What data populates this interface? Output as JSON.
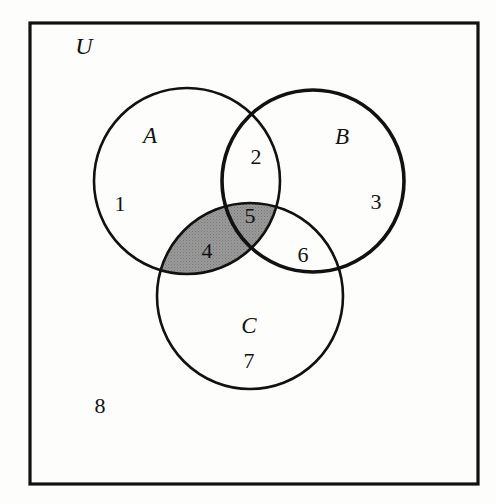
{
  "figure": {
    "type": "venn-diagram",
    "background_color": "#fdfdfb",
    "stroke_color": "#111111",
    "shade_color": "#969696",
    "text_color": "#121212"
  },
  "universe": {
    "label": "U",
    "rect": {
      "x": 30,
      "y": 23,
      "width": 448,
      "height": 461,
      "stroke_width": 3.2
    },
    "label_pos": {
      "x": 84,
      "y": 46
    }
  },
  "sets": [
    {
      "name": "A",
      "label": "A",
      "cx": 187,
      "cy": 181,
      "r": 93,
      "stroke_width": 2.6,
      "label_pos": {
        "x": 150,
        "y": 135
      }
    },
    {
      "name": "B",
      "label": "B",
      "cx": 313,
      "cy": 181,
      "r": 91,
      "stroke_width": 3.6,
      "label_pos": {
        "x": 342,
        "y": 136
      }
    },
    {
      "name": "C",
      "label": "C",
      "cx": 250,
      "cy": 296,
      "r": 93,
      "stroke_width": 2.6,
      "label_pos": {
        "x": 249,
        "y": 325
      }
    }
  ],
  "shaded": {
    "description": "A intersect C",
    "sets": [
      "A",
      "C"
    ],
    "fill": "#969696",
    "pattern": "stipple"
  },
  "regions": [
    {
      "id": "r1",
      "label": "1",
      "membership": "A only",
      "x": 120,
      "y": 204
    },
    {
      "id": "r2",
      "label": "2",
      "membership": "A and B",
      "x": 256,
      "y": 157
    },
    {
      "id": "r3",
      "label": "3",
      "membership": "B only",
      "x": 376,
      "y": 202
    },
    {
      "id": "r4",
      "label": "4",
      "membership": "A and C",
      "x": 207,
      "y": 251
    },
    {
      "id": "r5",
      "label": "5",
      "membership": "A and B and C",
      "x": 250,
      "y": 216
    },
    {
      "id": "r6",
      "label": "6",
      "membership": "B and C",
      "x": 303,
      "y": 255
    },
    {
      "id": "r7",
      "label": "7",
      "membership": "C only",
      "x": 249,
      "y": 361
    },
    {
      "id": "r8",
      "label": "8",
      "membership": "outside all",
      "x": 100,
      "y": 406
    }
  ],
  "chart_data": {
    "type": "diagram",
    "sets": [
      "A",
      "B",
      "C"
    ],
    "universe": "U",
    "region_labels": [
      "1",
      "2",
      "3",
      "4",
      "5",
      "6",
      "7",
      "8"
    ],
    "region_meanings": [
      "A only",
      "A and B",
      "B only",
      "A and C",
      "A and B and C",
      "B and C",
      "C only",
      "outside all sets"
    ],
    "shaded_regions": [
      "4",
      "5"
    ],
    "shaded_expression": "A and C"
  }
}
